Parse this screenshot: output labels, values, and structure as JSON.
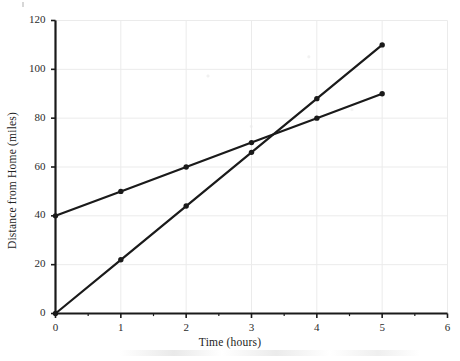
{
  "chart_data": {
    "type": "line",
    "title": "",
    "xlabel": "Time (hours)",
    "ylabel": "Distance from Home (miles)",
    "xlim": [
      0,
      6
    ],
    "ylim": [
      0,
      120
    ],
    "xticks": [
      0,
      1,
      2,
      3,
      4,
      5,
      6
    ],
    "xtick_labels": [
      "0",
      "1",
      "2",
      "3",
      "4",
      "5",
      "6"
    ],
    "yticks": [
      0,
      20,
      40,
      60,
      80,
      100,
      120
    ],
    "ytick_labels": [
      "0",
      "20",
      "40",
      "60",
      "80",
      "100",
      "120"
    ],
    "grid": true,
    "grid_color": "#ebebeb",
    "legend": "none",
    "line_color": "#1a1a1a",
    "marker": "circle",
    "x": [
      0,
      1,
      2,
      3,
      4,
      5
    ],
    "series": [
      {
        "name": "Traveler A (starts 40 miles from home)",
        "values": [
          40,
          50,
          60,
          70,
          80,
          90
        ],
        "slope_miles_per_hour": 10,
        "intercept_miles": 40
      },
      {
        "name": "Traveler B (starts at home)",
        "values": [
          0,
          22,
          44,
          66,
          88,
          110
        ],
        "slope_miles_per_hour": 22,
        "intercept_miles": 0
      }
    ],
    "annotations": [
      {
        "text": "lines intersect near (3.3, 73)",
        "x": 3.33,
        "y": 73.3
      }
    ]
  },
  "figure": {
    "x_axis_title": "Time (hours)",
    "y_axis_title": "Distance from Home (miles)"
  }
}
